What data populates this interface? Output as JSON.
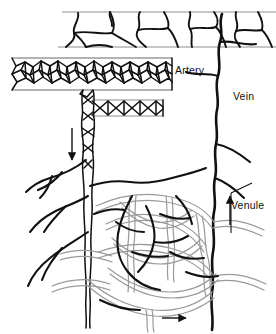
{
  "figure": {
    "background_color": "#ffffff",
    "ink_color": "#111111",
    "vessel_outline_color": "#9a9a9a",
    "plexus_band_color": "#b3b3b3"
  },
  "labels": {
    "artery": "Artery",
    "vein": "Vein",
    "venule": "Venule"
  },
  "structures": {
    "epidermis_band": "epidermis-layer",
    "superficial_plexus": "superficial-vascular-plexus",
    "deep_plexus": "deep-vascular-plexus",
    "arteriole_trunk": "descending-arteriole",
    "vein_trunk": "ascending-vein",
    "capillary_network": "capillary-loop-network",
    "nerve_fibers": "nerve-fiber-branches"
  },
  "flow_arrows": {
    "artery_down": "downward-flow-arrow",
    "venule_up": "upward-flow-arrow",
    "capillary_right": "rightward-flow-arrow"
  }
}
